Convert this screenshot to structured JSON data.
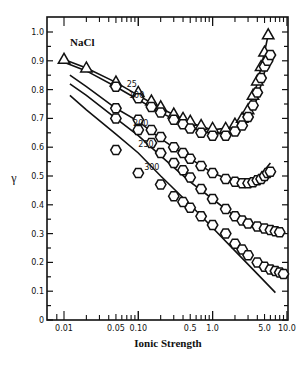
{
  "chart_data": {
    "type": "line",
    "title": "NaCl",
    "xlabel": "Ionic Strength",
    "ylabel": "γ",
    "xscale": "log",
    "xlim": [
      0.008,
      10.5
    ],
    "ylim": [
      0,
      1.05
    ],
    "x_tick_labels": [
      "0.01",
      "0.05",
      "0.10",
      "0.5",
      "1.0",
      "5.0",
      "10.0"
    ],
    "x_tick_values": [
      0.01,
      0.05,
      0.1,
      0.5,
      1.0,
      5.0,
      10.0
    ],
    "y_tick_labels": [
      "0",
      "0.1",
      "0.2",
      "0.3",
      "0.4",
      "0.5",
      "0.6",
      "0.7",
      "0.8",
      "0.9",
      "1.0"
    ],
    "y_tick_values": [
      0,
      0.1,
      0.2,
      0.3,
      0.4,
      0.5,
      0.6,
      0.7,
      0.8,
      0.9,
      1.0
    ],
    "grid": false,
    "legend": "inline curve labels",
    "series": [
      {
        "name": "25",
        "marker": "triangle",
        "label_at": [
          0.07,
          0.81
        ],
        "line": {
          "x": [
            0.01,
            0.02,
            0.05,
            0.1,
            0.2,
            0.5,
            1.0,
            2.0,
            3.0,
            4.0,
            5.0,
            5.6
          ],
          "y": [
            0.905,
            0.875,
            0.825,
            0.78,
            0.735,
            0.685,
            0.66,
            0.67,
            0.73,
            0.82,
            0.93,
            0.99
          ]
        },
        "points": {
          "x": [
            0.01,
            0.02,
            0.05,
            0.1,
            0.15,
            0.2,
            0.3,
            0.4,
            0.5,
            0.7,
            1.0,
            1.5,
            2.0,
            2.5,
            3.0,
            3.5,
            4.0,
            4.5,
            5.0,
            5.6
          ],
          "y": [
            0.905,
            0.875,
            0.826,
            0.79,
            0.76,
            0.74,
            0.715,
            0.7,
            0.69,
            0.675,
            0.665,
            0.665,
            0.68,
            0.7,
            0.73,
            0.78,
            0.83,
            0.88,
            0.93,
            0.99
          ]
        }
      },
      {
        "name": "100",
        "marker": "hexagon",
        "label_at": [
          0.075,
          0.77
        ],
        "line": {
          "x": [
            0.01,
            0.02,
            0.05,
            0.1,
            0.2,
            0.5,
            1.0,
            2.0,
            3.0,
            4.0,
            5.0,
            6.0
          ],
          "y": [
            0.895,
            0.865,
            0.81,
            0.765,
            0.72,
            0.67,
            0.645,
            0.65,
            0.7,
            0.77,
            0.86,
            0.93
          ]
        },
        "points": {
          "x": [
            0.05,
            0.1,
            0.15,
            0.2,
            0.3,
            0.4,
            0.5,
            0.7,
            1.0,
            1.5,
            2.0,
            2.5,
            3.0,
            3.5,
            4.0,
            4.5,
            5.0,
            5.5,
            6.0
          ],
          "y": [
            0.81,
            0.77,
            0.74,
            0.72,
            0.695,
            0.68,
            0.665,
            0.65,
            0.64,
            0.64,
            0.655,
            0.675,
            0.705,
            0.745,
            0.79,
            0.84,
            0.88,
            0.9,
            0.92
          ]
        }
      },
      {
        "name": "200",
        "marker": "hexagon",
        "label_at": [
          0.085,
          0.675
        ],
        "line": {
          "x": [
            0.012,
            0.02,
            0.05,
            0.1,
            0.2,
            0.5,
            1.0,
            2.0,
            3.0,
            4.0,
            5.0,
            6.0
          ],
          "y": [
            0.85,
            0.81,
            0.735,
            0.69,
            0.63,
            0.56,
            0.51,
            0.48,
            0.475,
            0.49,
            0.52,
            0.545
          ]
        },
        "points": {
          "x": [
            0.05,
            0.1,
            0.15,
            0.2,
            0.3,
            0.4,
            0.5,
            0.7,
            1.0,
            1.5,
            2.0,
            2.5,
            3.0,
            3.5,
            4.0,
            4.5,
            5.0,
            5.5,
            6.0
          ],
          "y": [
            0.735,
            0.695,
            0.66,
            0.635,
            0.6,
            0.58,
            0.56,
            0.535,
            0.51,
            0.49,
            0.48,
            0.475,
            0.475,
            0.478,
            0.485,
            0.49,
            0.5,
            0.51,
            0.515
          ]
        }
      },
      {
        "name": "250",
        "marker": "hexagon",
        "label_at": [
          0.1,
          0.6
        ],
        "line": {
          "x": [
            0.012,
            0.02,
            0.05,
            0.1,
            0.2,
            0.5,
            1.0,
            2.0,
            4.0,
            6.0,
            8.0
          ],
          "y": [
            0.82,
            0.78,
            0.7,
            0.64,
            0.57,
            0.48,
            0.42,
            0.36,
            0.325,
            0.31,
            0.305
          ]
        },
        "points": {
          "x": [
            0.05,
            0.1,
            0.15,
            0.2,
            0.3,
            0.4,
            0.5,
            0.7,
            1.0,
            1.5,
            2.0,
            2.5,
            3.0,
            4.0,
            5.0,
            6.0,
            7.0,
            8.0
          ],
          "y": [
            0.7,
            0.66,
            0.615,
            0.58,
            0.545,
            0.52,
            0.495,
            0.455,
            0.42,
            0.385,
            0.36,
            0.345,
            0.335,
            0.325,
            0.318,
            0.312,
            0.308,
            0.305
          ]
        }
      },
      {
        "name": "300",
        "marker": "hexagon",
        "label_at": [
          0.12,
          0.52
        ],
        "line": {
          "x": [
            0.012,
            0.02,
            0.05,
            0.1,
            0.2,
            0.5,
            1.0,
            2.0,
            4.0,
            7.0
          ],
          "y": [
            0.78,
            0.73,
            0.645,
            0.58,
            0.5,
            0.4,
            0.32,
            0.24,
            0.16,
            0.095
          ]
        },
        "points": {
          "x": [
            0.05,
            0.1,
            0.2,
            0.3,
            0.4,
            0.5,
            0.7,
            1.0,
            1.5,
            2.0,
            2.5,
            3.0,
            4.0,
            5.0,
            6.0,
            7.0,
            8.0,
            9.0
          ],
          "y": [
            0.59,
            0.51,
            0.47,
            0.43,
            0.41,
            0.39,
            0.36,
            0.33,
            0.3,
            0.265,
            0.245,
            0.225,
            0.2,
            0.185,
            0.175,
            0.17,
            0.165,
            0.16
          ]
        }
      }
    ]
  }
}
